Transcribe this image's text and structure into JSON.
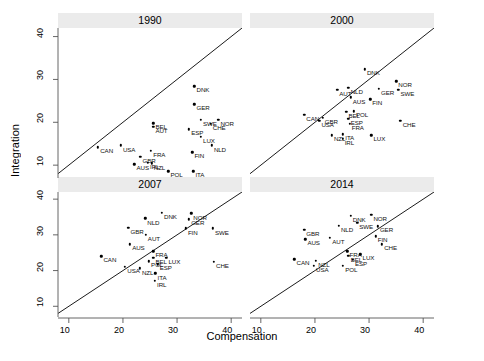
{
  "chart_data": {
    "type": "scatter",
    "title": "",
    "xlabel": "Compensation",
    "ylabel": "Integration",
    "xlim": [
      8,
      42
    ],
    "ylim": [
      7,
      42
    ],
    "xticks": [
      10,
      20,
      30,
      40
    ],
    "yticks": [
      10,
      20,
      30,
      40
    ],
    "grid": false,
    "legend": null,
    "annotation": "Each panel shows a 45-degree reference line; points are labelled with ISO-3 country codes.",
    "reference_line": {
      "type": "identity",
      "from": [
        8,
        8
      ],
      "to": [
        42,
        42
      ]
    },
    "facet_variable": "year",
    "panels": [
      {
        "label": "1990",
        "points": [
          {
            "code": "CAN",
            "x": 15.4,
            "y": 14.2
          },
          {
            "code": "USA",
            "x": 19.6,
            "y": 14.6
          },
          {
            "code": "AUS",
            "x": 22.1,
            "y": 10.2
          },
          {
            "code": "GBR",
            "x": 23.2,
            "y": 12.0
          },
          {
            "code": "IRL",
            "x": 24.6,
            "y": 10.6
          },
          {
            "code": "NZL",
            "x": 25.3,
            "y": 10.4
          },
          {
            "code": "FRA",
            "x": 25.2,
            "y": 13.4
          },
          {
            "code": "BEL",
            "x": 25.6,
            "y": 19.8
          },
          {
            "code": "AUT",
            "x": 25.6,
            "y": 18.9
          },
          {
            "code": "POL",
            "x": 28.4,
            "y": 8.6
          },
          {
            "code": "DNK",
            "x": 33.2,
            "y": 28.4
          },
          {
            "code": "GER",
            "x": 33.2,
            "y": 24.2
          },
          {
            "code": "SWE",
            "x": 34.4,
            "y": 20.6
          },
          {
            "code": "ESP",
            "x": 32.2,
            "y": 18.4
          },
          {
            "code": "CHE",
            "x": 36.2,
            "y": 19.6
          },
          {
            "code": "LUX",
            "x": 34.4,
            "y": 16.6
          },
          {
            "code": "NLD",
            "x": 36.4,
            "y": 14.6
          },
          {
            "code": "FIN",
            "x": 32.8,
            "y": 13.0
          },
          {
            "code": "NOR",
            "x": 37.6,
            "y": 20.6
          },
          {
            "code": "ITA",
            "x": 33.0,
            "y": 8.6
          }
        ]
      },
      {
        "label": "2000",
        "points": [
          {
            "code": "CAN",
            "x": 18.0,
            "y": 21.8
          },
          {
            "code": "USA",
            "x": 20.8,
            "y": 20.3
          },
          {
            "code": "GBR",
            "x": 21.4,
            "y": 21.0
          },
          {
            "code": "NZL",
            "x": 23.1,
            "y": 17.0
          },
          {
            "code": "IRL",
            "x": 25.1,
            "y": 16.2
          },
          {
            "code": "ITA",
            "x": 25.2,
            "y": 17.2
          },
          {
            "code": "AUT",
            "x": 24.1,
            "y": 27.6
          },
          {
            "code": "NLD",
            "x": 26.2,
            "y": 28.0
          },
          {
            "code": "AUS",
            "x": 26.6,
            "y": 25.8
          },
          {
            "code": "BEL",
            "x": 25.8,
            "y": 22.4
          },
          {
            "code": "POL",
            "x": 27.2,
            "y": 22.6
          },
          {
            "code": "ESP",
            "x": 26.2,
            "y": 20.8
          },
          {
            "code": "FRA",
            "x": 26.4,
            "y": 19.6
          },
          {
            "code": "DNK",
            "x": 29.2,
            "y": 32.4
          },
          {
            "code": "FIN",
            "x": 30.2,
            "y": 25.4
          },
          {
            "code": "GER",
            "x": 31.8,
            "y": 27.8
          },
          {
            "code": "LUX",
            "x": 30.4,
            "y": 17.0
          },
          {
            "code": "NOR",
            "x": 35.0,
            "y": 29.6
          },
          {
            "code": "SWE",
            "x": 35.4,
            "y": 27.6
          },
          {
            "code": "CHE",
            "x": 35.8,
            "y": 20.4
          }
        ]
      },
      {
        "label": "2007",
        "points": [
          {
            "code": "CAN",
            "x": 16.0,
            "y": 24.0
          },
          {
            "code": "USA",
            "x": 20.4,
            "y": 21.0
          },
          {
            "code": "GBR",
            "x": 21.0,
            "y": 32.0
          },
          {
            "code": "AUS",
            "x": 21.3,
            "y": 27.4
          },
          {
            "code": "NZL",
            "x": 23.1,
            "y": 20.6
          },
          {
            "code": "NLD",
            "x": 24.1,
            "y": 34.6
          },
          {
            "code": "AUT",
            "x": 24.2,
            "y": 30.0
          },
          {
            "code": "POL",
            "x": 24.8,
            "y": 22.6
          },
          {
            "code": "FRA",
            "x": 25.6,
            "y": 25.4
          },
          {
            "code": "BEL",
            "x": 25.6,
            "y": 23.6
          },
          {
            "code": "ITA",
            "x": 26.0,
            "y": 19.2
          },
          {
            "code": "IRL",
            "x": 25.9,
            "y": 17.2
          },
          {
            "code": "ESP",
            "x": 26.4,
            "y": 21.8
          },
          {
            "code": "DNK",
            "x": 27.2,
            "y": 36.2
          },
          {
            "code": "LUX",
            "x": 28.0,
            "y": 23.6
          },
          {
            "code": "FIN",
            "x": 31.6,
            "y": 31.8
          },
          {
            "code": "GER",
            "x": 32.2,
            "y": 34.4
          },
          {
            "code": "NOR",
            "x": 32.6,
            "y": 36.0
          },
          {
            "code": "SWE",
            "x": 36.6,
            "y": 31.8
          },
          {
            "code": "CHE",
            "x": 36.8,
            "y": 22.4
          }
        ]
      },
      {
        "label": "2014",
        "points": [
          {
            "code": "CAN",
            "x": 16.2,
            "y": 23.2
          },
          {
            "code": "GBR",
            "x": 18.0,
            "y": 31.4
          },
          {
            "code": "AUS",
            "x": 18.2,
            "y": 28.8
          },
          {
            "code": "USA",
            "x": 19.8,
            "y": 21.4
          },
          {
            "code": "NZL",
            "x": 20.2,
            "y": 22.8
          },
          {
            "code": "AUT",
            "x": 22.8,
            "y": 29.2
          },
          {
            "code": "NLD",
            "x": 24.4,
            "y": 32.6
          },
          {
            "code": "POL",
            "x": 25.2,
            "y": 21.4
          },
          {
            "code": "FRA",
            "x": 26.0,
            "y": 25.4
          },
          {
            "code": "BEL",
            "x": 26.2,
            "y": 24.2
          },
          {
            "code": "ESP",
            "x": 27.0,
            "y": 23.0
          },
          {
            "code": "DNK",
            "x": 26.6,
            "y": 35.4
          },
          {
            "code": "SWE",
            "x": 27.8,
            "y": 33.4
          },
          {
            "code": "LUX",
            "x": 28.4,
            "y": 24.6
          },
          {
            "code": "NOR",
            "x": 30.4,
            "y": 35.6
          },
          {
            "code": "GER",
            "x": 31.6,
            "y": 32.4
          },
          {
            "code": "FIN",
            "x": 31.2,
            "y": 29.6
          },
          {
            "code": "CHE",
            "x": 32.4,
            "y": 27.4
          }
        ]
      }
    ]
  }
}
